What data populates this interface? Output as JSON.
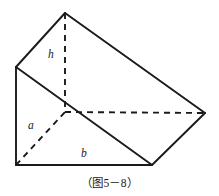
{
  "figure": {
    "caption": "（图5－8）",
    "labels": {
      "height": "h",
      "side_a": "a",
      "side_b": "b"
    },
    "colors": {
      "stroke": "#1a1a1a",
      "background": "#ffffff"
    },
    "diagram": {
      "type": "triangular-prism",
      "description": "Oblique view of a triangular prism with hidden edges shown dashed",
      "vertices": {
        "apex_top": [
          65,
          13
        ],
        "left_upper": [
          16,
          67
        ],
        "bottom_left": [
          16,
          165
        ],
        "bottom_right": [
          152,
          165
        ],
        "right_far": [
          205,
          113
        ],
        "center_hidden": [
          65,
          112
        ]
      },
      "solid_edges": [
        [
          [
            65,
            13
          ],
          [
            16,
            67
          ]
        ],
        [
          [
            65,
            13
          ],
          [
            205,
            113
          ]
        ],
        [
          [
            16,
            67
          ],
          [
            16,
            165
          ]
        ],
        [
          [
            16,
            67
          ],
          [
            152,
            165
          ]
        ],
        [
          [
            16,
            165
          ],
          [
            152,
            165
          ]
        ],
        [
          [
            152,
            165
          ],
          [
            205,
            113
          ]
        ]
      ],
      "dashed_edges": [
        [
          [
            65,
            13
          ],
          [
            65,
            112
          ]
        ],
        [
          [
            65,
            112
          ],
          [
            205,
            113
          ]
        ],
        [
          [
            16,
            165
          ],
          [
            65,
            112
          ]
        ]
      ]
    }
  }
}
